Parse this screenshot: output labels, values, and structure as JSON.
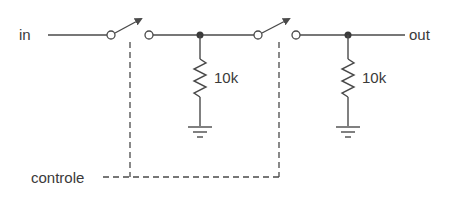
{
  "diagram": {
    "type": "circuit-schematic",
    "labels": {
      "input": "in",
      "output": "out",
      "control": "controle"
    },
    "components": [
      {
        "id": "S1",
        "kind": "switch",
        "state": "open",
        "controlled_by": "controle"
      },
      {
        "id": "R1",
        "kind": "resistor",
        "value": "10k",
        "to": "ground"
      },
      {
        "id": "S2",
        "kind": "switch",
        "state": "open",
        "controlled_by": "controle"
      },
      {
        "id": "R2",
        "kind": "resistor",
        "value": "10k",
        "to": "ground"
      }
    ],
    "resistors": [
      {
        "label": "10k"
      },
      {
        "label": "10k"
      }
    ],
    "colors": {
      "line": "#4a4a4a",
      "text": "#3a3a3a",
      "background": "#ffffff"
    }
  }
}
